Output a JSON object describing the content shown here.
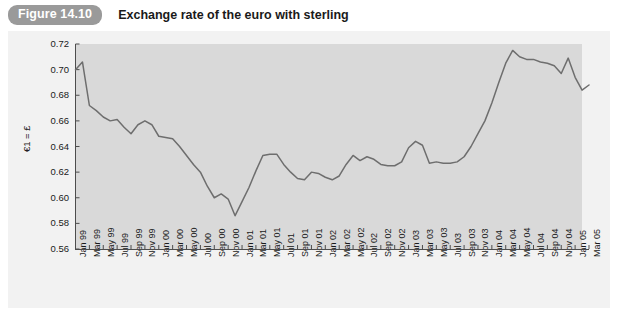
{
  "figure": {
    "badge": "Figure 14.10",
    "title": "Exchange rate of the euro with sterling"
  },
  "colors": {
    "badge_background": "#9a9a9a",
    "panel_background": "#f2f2f2",
    "plot_background": "#d9d9d9",
    "line": "#6e6e6e",
    "axis": "#4d4d4d",
    "text": "#1a1a1a"
  },
  "chart_data": {
    "type": "line",
    "title": "Exchange rate of the euro with sterling",
    "xlabel": "",
    "ylabel": "€1 = £",
    "ylim": [
      0.56,
      0.72
    ],
    "ytick_labels": [
      "0.72",
      "0.70",
      "0.68",
      "0.66",
      "0.64",
      "0.62",
      "0.60",
      "0.58",
      "0.56"
    ],
    "ytick_values": [
      0.72,
      0.7,
      0.68,
      0.66,
      0.64,
      0.62,
      0.6,
      0.58,
      0.56
    ],
    "grid": false,
    "legend": false,
    "xtick_labels": [
      "Jan 99",
      "Mar 99",
      "May 99",
      "Jul 99",
      "Sep 99",
      "Nov 99",
      "Jan 00",
      "Mar 00",
      "May 00",
      "Jul 00",
      "Sep 00",
      "Nov 00",
      "Jan 01",
      "Mar 01",
      "May 01",
      "Jul 01",
      "Sep 01",
      "Nov 01",
      "Jan 02",
      "Mar 02",
      "May 02",
      "Jul 02",
      "Sep 02",
      "Nov 02",
      "Jan 03",
      "Mar 03",
      "May 03",
      "Jul 03",
      "Sep 03",
      "Nov 03",
      "Jan 04",
      "Mar 04",
      "May 04",
      "Jul 04",
      "Sep 04",
      "Nov 04",
      "Jan 05",
      "Mar 05"
    ],
    "series": [
      {
        "name": "€1 = £",
        "x": [
          "Jan 99",
          "Feb 99",
          "Mar 99",
          "Apr 99",
          "May 99",
          "Jun 99",
          "Jul 99",
          "Aug 99",
          "Sep 99",
          "Oct 99",
          "Nov 99",
          "Dec 99",
          "Jan 00",
          "Feb 00",
          "Mar 00",
          "Apr 00",
          "May 00",
          "Jun 00",
          "Jul 00",
          "Aug 00",
          "Sep 00",
          "Oct 00",
          "Nov 00",
          "Dec 00",
          "Jan 01",
          "Feb 01",
          "Mar 01",
          "Apr 01",
          "May 01",
          "Jun 01",
          "Jul 01",
          "Aug 01",
          "Sep 01",
          "Oct 01",
          "Nov 01",
          "Dec 01",
          "Jan 02",
          "Feb 02",
          "Mar 02",
          "Apr 02",
          "May 02",
          "Jun 02",
          "Jul 02",
          "Aug 02",
          "Sep 02",
          "Oct 02",
          "Nov 02",
          "Dec 02",
          "Jan 03",
          "Feb 03",
          "Mar 03",
          "Apr 03",
          "May 03",
          "Jun 03",
          "Jul 03",
          "Aug 03",
          "Sep 03",
          "Oct 03",
          "Nov 03",
          "Dec 03",
          "Jan 04",
          "Feb 04",
          "Mar 04",
          "Apr 04",
          "May 04",
          "Jun 04",
          "Jul 04",
          "Aug 04",
          "Sep 04",
          "Oct 04",
          "Nov 04",
          "Dec 04",
          "Jan 05",
          "Feb 05",
          "Mar 05"
        ],
        "values": [
          0.7,
          0.706,
          0.672,
          0.668,
          0.663,
          0.66,
          0.661,
          0.655,
          0.65,
          0.657,
          0.66,
          0.657,
          0.648,
          0.647,
          0.646,
          0.64,
          0.633,
          0.626,
          0.62,
          0.609,
          0.6,
          0.603,
          0.599,
          0.586,
          0.597,
          0.608,
          0.621,
          0.633,
          0.634,
          0.634,
          0.626,
          0.62,
          0.615,
          0.614,
          0.62,
          0.619,
          0.616,
          0.614,
          0.617,
          0.626,
          0.633,
          0.629,
          0.632,
          0.63,
          0.626,
          0.625,
          0.625,
          0.628,
          0.639,
          0.644,
          0.641,
          0.627,
          0.628,
          0.627,
          0.627,
          0.628,
          0.632,
          0.64,
          0.65,
          0.66,
          0.674,
          0.69,
          0.705,
          0.715,
          0.71,
          0.708,
          0.708,
          0.706,
          0.705,
          0.703,
          0.697,
          0.709,
          0.694,
          0.684,
          0.688
        ]
      }
    ],
    "annotations": {
      "minimum": {
        "label": "Dec 00",
        "value": 0.586
      },
      "maximum": {
        "label": "Apr 03",
        "value": 0.715
      }
    }
  }
}
